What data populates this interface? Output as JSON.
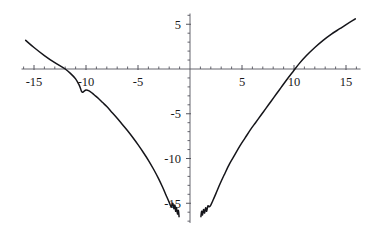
{
  "chart_data": {
    "type": "line",
    "title": "",
    "subtitle": "",
    "xlabel": "",
    "ylabel": "",
    "xlim": [
      -16.2,
      16.4
    ],
    "ylim": [
      -17.2,
      6.2
    ],
    "grid": false,
    "legend": null,
    "axes_style": "centered-cross-at-origin",
    "x_major_ticks": [
      -15,
      -10,
      -5,
      5,
      10,
      15
    ],
    "x_major_tick_labels": [
      "-15",
      "-10",
      "-5",
      "5",
      "10",
      "15"
    ],
    "y_major_ticks": [
      5,
      -5,
      -10,
      -15
    ],
    "y_major_tick_labels": [
      "5",
      "-5",
      "-10",
      "-15"
    ],
    "x_minor_tick_step": 1,
    "y_minor_tick_step": 1,
    "zero_tick_labels_hidden": true,
    "curve_color": "#15151a",
    "axis_color": "#55555e",
    "background_color": "#ffffff",
    "roots": [
      -12.0,
      9.3
    ],
    "notable_features": [
      "symmetric V-shaped well centered near x = 0",
      "notch / local dip on left branch near x = -10.5",
      "oscillatory wiggles near the minimum at both inner ends",
      "curve is undefined in a narrow band around x = 0"
    ],
    "series": [
      {
        "name": "left-branch",
        "x": [
          -15.8,
          -15.0,
          -14.0,
          -13.0,
          -12.0,
          -11.4,
          -11.0,
          -10.7,
          -10.55,
          -10.45,
          -10.35,
          -10.2,
          -10.0,
          -9.7,
          -9.4,
          -9.1,
          -8.8,
          -8.4,
          -8.0,
          -7.5,
          -7.0,
          -6.5,
          -6.0,
          -5.5,
          -5.0,
          -4.5,
          -4.0,
          -3.5,
          -3.0,
          -2.6,
          -2.3,
          -2.0,
          -1.8,
          -1.65,
          -1.55,
          -1.45,
          -1.38,
          -1.3,
          -1.2,
          -1.12,
          -1.05
        ],
        "y": [
          3.2,
          2.4,
          1.5,
          0.7,
          0.0,
          -0.6,
          -1.1,
          -1.7,
          -2.1,
          -2.45,
          -2.6,
          -2.5,
          -2.35,
          -2.45,
          -2.7,
          -3.0,
          -3.3,
          -3.75,
          -4.2,
          -4.85,
          -5.5,
          -6.2,
          -6.9,
          -7.65,
          -8.45,
          -9.3,
          -10.2,
          -11.2,
          -12.3,
          -13.3,
          -14.1,
          -14.9,
          -15.4,
          -15.0,
          -15.6,
          -15.2,
          -15.9,
          -15.5,
          -16.2,
          -15.8,
          -16.5
        ]
      },
      {
        "name": "right-branch",
        "x": [
          1.05,
          1.12,
          1.2,
          1.3,
          1.4,
          1.5,
          1.6,
          1.72,
          1.85,
          2.0,
          2.2,
          2.5,
          2.9,
          3.3,
          3.8,
          4.3,
          4.8,
          5.3,
          5.8,
          6.3,
          6.8,
          7.3,
          7.8,
          8.3,
          8.8,
          9.3,
          9.9,
          10.5,
          11.2,
          12.0,
          12.8,
          13.6,
          14.4,
          15.2,
          15.9
        ],
        "y": [
          -16.5,
          -15.9,
          -16.3,
          -15.7,
          -16.1,
          -15.5,
          -15.9,
          -15.3,
          -15.4,
          -15.2,
          -14.7,
          -13.9,
          -12.8,
          -11.8,
          -10.6,
          -9.6,
          -8.6,
          -7.7,
          -6.8,
          -6.0,
          -5.2,
          -4.4,
          -3.6,
          -2.8,
          -2.0,
          -1.2,
          -0.3,
          0.6,
          1.5,
          2.4,
          3.2,
          3.9,
          4.5,
          5.1,
          5.6
        ]
      }
    ]
  },
  "plot": {
    "geometry": {
      "origin_x_px": 190,
      "origin_y_px": 69,
      "px_per_unit_x": 10.4,
      "px_per_unit_y": 8.95,
      "tick_len_minor_px": 2.5,
      "tick_len_major_px": 4
    }
  }
}
